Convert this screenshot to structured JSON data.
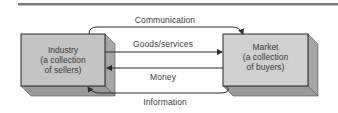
{
  "diagram": {
    "type": "flow",
    "nodes": [
      {
        "id": "industry",
        "lines": [
          "Industry",
          "(a collection",
          "of sellers)"
        ]
      },
      {
        "id": "market",
        "lines": [
          "Market",
          "(a collection",
          "of buyers)"
        ]
      }
    ],
    "edges": [
      {
        "id": "communication",
        "label": "Communication",
        "from": "industry",
        "to": "market"
      },
      {
        "id": "goods",
        "label": "Goods/services",
        "from": "industry",
        "to": "market"
      },
      {
        "id": "money",
        "label": "Money",
        "from": "market",
        "to": "industry"
      },
      {
        "id": "information",
        "label": "Information",
        "from": "market",
        "to": "industry"
      }
    ],
    "colors": {
      "box_front": "#c4c4c4",
      "box_side": "#a6a6a6",
      "box_bottom": "#9a9a9a",
      "line": "#2a2a2a",
      "rule": "#7a7a7a",
      "text": "#3a3a3a"
    }
  }
}
